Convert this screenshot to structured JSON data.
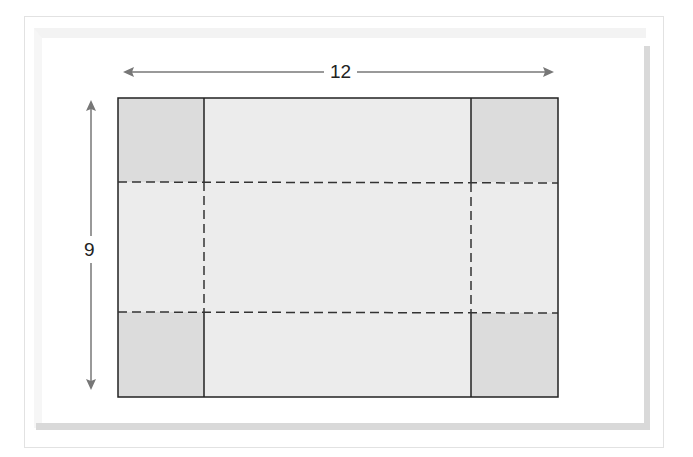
{
  "diagram": {
    "type": "box-net-with-cut-corners",
    "dimensions": {
      "width_label": "12",
      "height_label": "9"
    },
    "sheet": {
      "width_units": 12,
      "height_units": 9,
      "fill": "#ececec",
      "stroke": "#222222"
    },
    "corner_squares": {
      "count": 4,
      "fill": "#dcdcdc",
      "positions": [
        "top-left",
        "top-right",
        "bottom-left",
        "bottom-right"
      ]
    },
    "fold_lines": {
      "style": "dashed",
      "horizontal_count": 2,
      "vertical_count": 2,
      "color": "#333333"
    },
    "arrows": {
      "color": "#777777",
      "horizontal": "double-headed",
      "vertical": "double-headed"
    }
  }
}
